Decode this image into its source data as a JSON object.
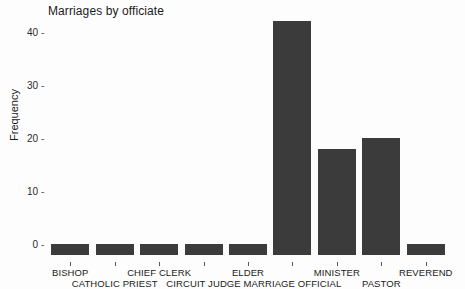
{
  "chart_data": {
    "type": "bar",
    "title": "Marriages by officiate",
    "xlabel": "",
    "ylabel": "Frequency",
    "categories": [
      "BISHOP",
      "CATHOLIC PRIEST",
      "CHIEF CLERK",
      "CIRCUIT JUDGE",
      "ELDER",
      "MARRIAGE OFFICIAL",
      "MINISTER",
      "PASTOR",
      "REVEREND"
    ],
    "values": [
      2,
      2,
      2,
      2,
      2,
      44,
      20,
      22,
      2
    ],
    "ylim": [
      0,
      45
    ],
    "yticks": [
      0,
      10,
      20,
      30,
      40
    ],
    "ytick_labels": [
      "0",
      "10",
      "20",
      "30",
      "40"
    ],
    "grid": false,
    "legend": false,
    "bar_color": "#3b3b3b",
    "background_color": "#fdfdfd",
    "label_rows": [
      0,
      1,
      0,
      1,
      0,
      1,
      0,
      1,
      0
    ]
  }
}
